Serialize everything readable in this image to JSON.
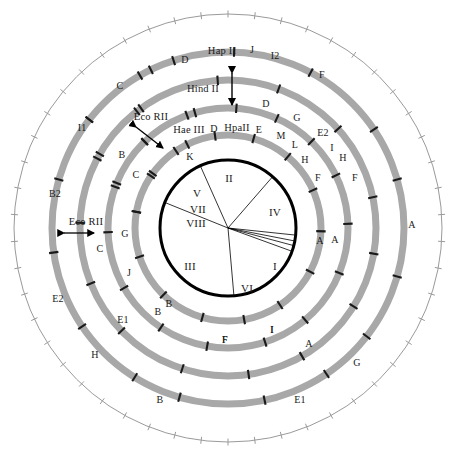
{
  "figure": {
    "kind": "circular restriction map",
    "center": [
      228,
      228
    ],
    "colors": {
      "ring_gray": "#a8a8a8",
      "tick_dark": "#1a1a1a",
      "inner_circle": "#000000",
      "scale_circle": "#9a9a9a",
      "background": "#ffffff"
    }
  },
  "scale_circle": {
    "name": "outer-scale-circle",
    "radius": 214,
    "tick_count": 50,
    "tick_length": 7,
    "stroke": "#9a9a9a"
  },
  "enzyme_rings": [
    {
      "id": "ring-hap-ii",
      "enzyme": "Hap II",
      "enzyme_label": {
        "text": "Hap II",
        "x": 222,
        "y": 51
      },
      "radius": 176,
      "thickness": 7,
      "cuts_deg": [
        -52,
        -26,
        -18,
        2,
        28,
        56,
        74,
        106,
        128,
        146,
        168,
        196,
        212,
        236,
        262,
        286,
        308,
        330
      ],
      "fragments": [
        {
          "label": "D",
          "x": 185,
          "y": 60
        },
        {
          "label": "J",
          "x": 252,
          "y": 50
        },
        {
          "label": "I2",
          "x": 275,
          "y": 56
        },
        {
          "label": "F",
          "x": 322,
          "y": 75
        },
        {
          "label": "A",
          "x": 412,
          "y": 225
        },
        {
          "label": "G",
          "x": 357,
          "y": 363
        },
        {
          "label": "E1",
          "x": 300,
          "y": 400
        },
        {
          "label": "B",
          "x": 160,
          "y": 400
        },
        {
          "label": "H",
          "x": 95,
          "y": 355
        },
        {
          "label": "E2",
          "x": 58,
          "y": 299
        },
        {
          "label": "B2",
          "x": 55,
          "y": 194
        },
        {
          "label": "I1",
          "x": 82,
          "y": 128
        },
        {
          "label": "C",
          "x": 120,
          "y": 86
        }
      ]
    },
    {
      "id": "ring-eco-rii",
      "enzyme": "Eco RII",
      "enzyme_label": {
        "text": "Eco RII",
        "x": 151,
        "y": 117
      },
      "enzyme_label_2": {
        "text": "Eco RII",
        "x": 86,
        "y": 222
      },
      "radius": 148,
      "thickness": 7,
      "cuts_deg": [
        -62,
        -36,
        -4,
        20,
        48,
        78,
        100,
        122,
        150,
        172,
        198,
        226,
        248,
        272,
        300,
        322
      ],
      "fragments": [
        {
          "label": "D",
          "x": 266,
          "y": 104
        },
        {
          "label": "G",
          "x": 297,
          "y": 118
        },
        {
          "label": "E2",
          "x": 323,
          "y": 133
        },
        {
          "label": "I",
          "x": 332,
          "y": 148
        },
        {
          "label": "H",
          "x": 343,
          "y": 158
        },
        {
          "label": "F",
          "x": 355,
          "y": 178
        },
        {
          "label": "A",
          "x": 335,
          "y": 240
        },
        {
          "label": "A",
          "x": 309,
          "y": 344
        },
        {
          "label": "I",
          "x": 272,
          "y": 330
        },
        {
          "label": "F",
          "x": 225,
          "y": 340
        },
        {
          "label": "B",
          "x": 158,
          "y": 312
        },
        {
          "label": "E1",
          "x": 123,
          "y": 320
        },
        {
          "label": "C",
          "x": 100,
          "y": 249
        },
        {
          "label": "B",
          "x": 122,
          "y": 155
        }
      ]
    },
    {
      "id": "ring-hpa-ii",
      "enzyme": "HpaII",
      "enzyme_label": {
        "text": "HpaII",
        "x": 237,
        "y": 128
      },
      "radius": 120,
      "thickness": 7,
      "cuts_deg": [
        -70,
        -44,
        -16,
        4,
        24,
        44,
        64,
        88,
        112,
        140,
        162,
        190,
        214,
        240,
        268,
        292,
        316,
        340
      ],
      "fragments": [
        {
          "label": "E",
          "x": 259,
          "y": 130
        },
        {
          "label": "M",
          "x": 281,
          "y": 136
        },
        {
          "label": "L",
          "x": 295,
          "y": 145
        },
        {
          "label": "H",
          "x": 305,
          "y": 160
        },
        {
          "label": "F",
          "x": 318,
          "y": 178
        },
        {
          "label": "A",
          "x": 320,
          "y": 241
        },
        {
          "label": "I",
          "x": 272,
          "y": 330
        },
        {
          "label": "F",
          "x": 225,
          "y": 340
        },
        {
          "label": "J",
          "x": 129,
          "y": 273
        },
        {
          "label": "G",
          "x": 125,
          "y": 234
        },
        {
          "label": "C",
          "x": 136,
          "y": 175
        },
        {
          "label": "K",
          "x": 190,
          "y": 157
        }
      ]
    },
    {
      "id": "ring-hae-iii",
      "enzyme": "Hae III",
      "enzyme_label": {
        "text": "Hae III",
        "x": 189,
        "y": 130
      },
      "radius": 93,
      "thickness": 7,
      "cuts_deg": [
        -80,
        -56,
        -34,
        -8,
        16,
        40,
        66,
        92,
        118,
        146,
        170,
        196,
        224,
        252,
        280,
        306,
        334
      ],
      "fragments": [
        {
          "label": "D",
          "x": 214,
          "y": 129
        },
        {
          "label": "B",
          "x": 169,
          "y": 304
        }
      ]
    }
  ],
  "hind_ii": {
    "name": "hind-ii-annotation",
    "label": "Hind II",
    "label_pos": {
      "x": 203,
      "y": 89
    },
    "arrow": {
      "x": 232,
      "y_top": 72,
      "y_bottom": 106
    }
  },
  "eco_rii_arrows": [
    {
      "name": "eco-rii-arrow-upper",
      "x1": 136,
      "y1": 127,
      "x2": 163,
      "y2": 148
    },
    {
      "name": "eco-rii-arrow-lower",
      "x1": 64,
      "y1": 233,
      "x2": 94,
      "y2": 233
    }
  ],
  "inner_circle": {
    "name": "inner-genome-circle",
    "radius": 68,
    "stroke": "#000000",
    "stroke_width": 3,
    "sector_boundaries_deg": [
      -68,
      -24,
      41,
      96,
      101,
      105,
      110,
      175
    ],
    "sectors": [
      {
        "label": "II",
        "x": 229,
        "y": 178
      },
      {
        "label": "IV",
        "x": 275,
        "y": 212
      },
      {
        "label": "I",
        "x": 275,
        "y": 266
      },
      {
        "label": "VI",
        "x": 247,
        "y": 288
      },
      {
        "label": "III",
        "x": 190,
        "y": 266
      },
      {
        "label": "VIII",
        "x": 196,
        "y": 223
      },
      {
        "label": "VII",
        "x": 198,
        "y": 209
      },
      {
        "label": "V",
        "x": 197,
        "y": 193
      }
    ]
  }
}
